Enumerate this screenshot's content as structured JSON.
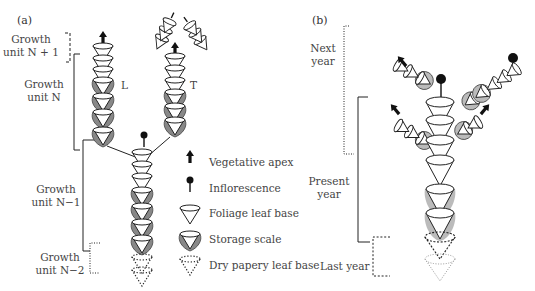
{
  "panel_a": {
    "label": "(a)",
    "growth_units": [
      {
        "line1": "Growth",
        "line2": "unit N + 1",
        "bracket": "dashed"
      },
      {
        "line1": "Growth",
        "line2": "unit N",
        "bracket": "solid"
      },
      {
        "line1": "Growth",
        "line2": "unit N−1",
        "bracket": "solid"
      },
      {
        "line1": "Growth",
        "line2": "unit N−2",
        "bracket": "dotted"
      }
    ],
    "shoot_labels": {
      "left": "L",
      "terminal": "T"
    }
  },
  "legend": {
    "items": [
      {
        "icon": "vegetative-apex-arrow-icon",
        "label": "Vegetative apex"
      },
      {
        "icon": "inflorescence-pin-icon",
        "label": "Inflorescence"
      },
      {
        "icon": "foliage-leaf-cone-icon",
        "label": "Foliage leaf base"
      },
      {
        "icon": "storage-scale-cone-icon",
        "label": "Storage scale"
      },
      {
        "icon": "dry-papery-dotted-cone-icon",
        "label": "Dry papery leaf base"
      }
    ]
  },
  "panel_b": {
    "label": "(b)",
    "years": [
      {
        "line1": "Next",
        "line2": "year",
        "bracket": "dotted"
      },
      {
        "line1": "Present",
        "line2": "year",
        "bracket": "solid"
      },
      {
        "line1": "Last year",
        "line2": "",
        "bracket": "dashed"
      }
    ]
  }
}
